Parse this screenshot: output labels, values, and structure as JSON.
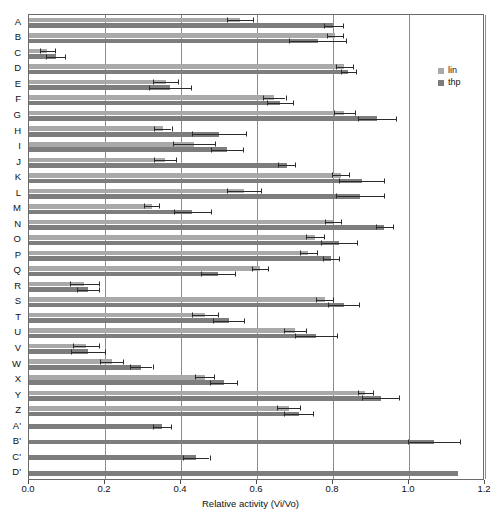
{
  "chart_data": {
    "type": "bar",
    "orientation": "horizontal",
    "title": "",
    "xlabel": "Relative activity (Vi/Vo)",
    "ylabel": "",
    "xlim": [
      0.0,
      1.2
    ],
    "xticks": [
      0.0,
      0.2,
      0.4,
      0.6,
      0.8,
      1.0,
      1.2
    ],
    "xticklabels": [
      "0.0",
      "0.2",
      "0.4",
      "0.6",
      "0.8",
      "1.0",
      "1.2"
    ],
    "grid": "vertical",
    "legend_position": "top-right-outside",
    "legend": [
      {
        "name": "lin",
        "color": "#a9a9a9"
      },
      {
        "name": "thp",
        "color": "#7d7d7d"
      }
    ],
    "categories": [
      "A",
      "B",
      "C",
      "D",
      "E",
      "F",
      "G",
      "H",
      "I",
      "J",
      "K",
      "L",
      "M",
      "N",
      "O",
      "P",
      "Q",
      "R",
      "S",
      "T",
      "U",
      "V",
      "W",
      "X",
      "Y",
      "Z",
      "A'",
      "B'",
      "C'",
      "D'"
    ],
    "series": [
      {
        "name": "lin",
        "color": "#a9a9a9",
        "values": [
          0.555,
          0.805,
          0.048,
          0.83,
          0.36,
          0.645,
          0.83,
          0.352,
          0.435,
          0.358,
          0.82,
          0.565,
          0.323,
          0.8,
          0.752,
          0.735,
          0.608,
          0.145,
          0.778,
          0.463,
          0.7,
          0.15,
          0.218,
          0.462,
          0.885,
          0.683,
          null,
          null,
          null,
          null
        ],
        "errors": [
          0.035,
          0.022,
          0.02,
          0.023,
          0.033,
          0.03,
          0.027,
          0.023,
          0.055,
          0.03,
          0.023,
          0.045,
          0.02,
          0.022,
          0.024,
          0.022,
          0.02,
          0.038,
          0.022,
          0.035,
          0.03,
          0.035,
          0.03,
          0.025,
          0.02,
          0.03,
          null,
          null,
          null,
          null
        ]
      },
      {
        "name": "thp",
        "color": "#7d7d7d",
        "values": [
          0.8,
          0.76,
          0.07,
          0.84,
          0.372,
          0.66,
          0.915,
          0.5,
          0.522,
          0.678,
          0.875,
          0.87,
          0.43,
          0.935,
          0.815,
          0.795,
          0.498,
          0.155,
          0.828,
          0.525,
          0.755,
          0.155,
          0.295,
          0.512,
          0.925,
          0.71,
          0.35,
          1.065,
          0.44,
          1.13
        ],
        "errors": [
          0.025,
          0.075,
          0.025,
          0.02,
          0.055,
          0.035,
          0.05,
          0.07,
          0.042,
          0.022,
          0.058,
          0.063,
          0.048,
          0.022,
          0.047,
          0.022,
          0.045,
          0.028,
          0.04,
          0.04,
          0.055,
          0.045,
          0.03,
          0.035,
          0.048,
          0.038,
          0.023,
          0.068,
          0.035,
          0.0
        ]
      }
    ]
  }
}
